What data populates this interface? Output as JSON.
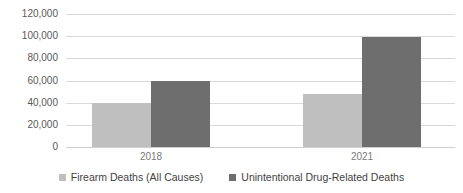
{
  "chart_data": {
    "type": "bar",
    "title": "",
    "subtitle": "",
    "xlabel": "",
    "ylabel": "",
    "categories": [
      "2018",
      "2021"
    ],
    "series": [
      {
        "name": "Firearm Deaths (All Causes)",
        "color": "#bfbfbf",
        "values": [
          40000,
          48000
        ]
      },
      {
        "name": "Unintentional Drug-Related Deaths",
        "color": "#6e6e6e",
        "values": [
          60000,
          99000
        ]
      }
    ],
    "ylim": [
      0,
      120000
    ],
    "ytick_values": [
      0,
      20000,
      40000,
      60000,
      80000,
      100000,
      120000
    ],
    "ytick_labels": [
      "0",
      "20,000",
      "40,000",
      "60,000",
      "80,000",
      "100,000",
      "120,000"
    ],
    "grid": true,
    "grid_axis": "y",
    "legend_position": "bottom",
    "annotations": []
  },
  "colors": {
    "series_light": "#bfbfbf",
    "series_dark": "#6e6e6e",
    "gridline": "#d9d9d9",
    "axis_text": "#595959",
    "category_text": "#7a7a7a",
    "legend_text": "#3f3f3f",
    "background": "#ffffff"
  }
}
